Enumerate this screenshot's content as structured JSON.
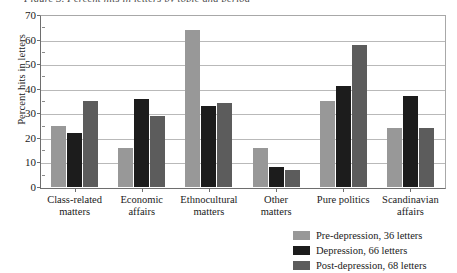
{
  "figure": {
    "top_caption_fragment": "Figure 3. Percent hits in letters by topic and period"
  },
  "chart_data": {
    "type": "bar",
    "title": "",
    "subtitle": "",
    "xlabel": "",
    "ylabel": "Percent hits in letters",
    "ylim": [
      0,
      70
    ],
    "ytick_step": 10,
    "yticks": [
      0,
      10,
      20,
      30,
      40,
      50,
      60,
      70
    ],
    "ytick_labels": [
      "0",
      "10",
      "20",
      "30",
      "40",
      "50",
      "60",
      "70"
    ],
    "minor_tick_step": 5,
    "grid": true,
    "grid_axis": "y",
    "legend_position": "bottom-right",
    "categories": [
      "Class-related matters",
      "Economic affairs",
      "Ethnocultural matters",
      "Other matters",
      "Pure politics",
      "Scandinavian affairs"
    ],
    "category_lines": [
      [
        "Class-related",
        "matters"
      ],
      [
        "Economic",
        "affairs"
      ],
      [
        "Ethnocultural",
        "matters"
      ],
      [
        "Other",
        "matters"
      ],
      [
        "Pure politics"
      ],
      [
        "Scandinavian",
        "affairs"
      ]
    ],
    "series": [
      {
        "name": "Pre-depression, 36 letters",
        "color": "#989898",
        "values": [
          25,
          16,
          64,
          16,
          35,
          24
        ]
      },
      {
        "name": "Depression, 66 letters",
        "color": "#1c1c1c",
        "values": [
          22,
          36,
          33,
          8,
          41,
          37
        ]
      },
      {
        "name": "Post-depression, 68 letters",
        "color": "#5c5c5c",
        "values": [
          35,
          29,
          34,
          7,
          58,
          24
        ]
      }
    ]
  },
  "legend": {
    "items": [
      {
        "label": "Pre-depression, 36 letters",
        "color": "#989898"
      },
      {
        "label": "Depression, 66 letters",
        "color": "#1c1c1c"
      },
      {
        "label": "Post-depression, 68 letters",
        "color": "#5c5c5c"
      }
    ]
  }
}
